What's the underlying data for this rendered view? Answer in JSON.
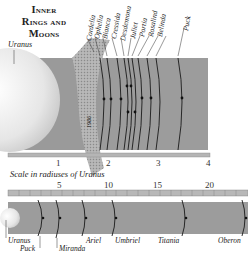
{
  "title": {
    "line1": "Inner",
    "line2": "Rings and",
    "line3": "Moons"
  },
  "top_panel": {
    "planet_label": "Uranus",
    "ring_label": "1986",
    "moon_labels": [
      "Cordelia",
      "Ophelia",
      "Bianca",
      "Cressida",
      "Desdemona",
      "Juliet",
      "Portia",
      "Rosalind",
      "Belinda",
      "Puck"
    ],
    "scale_ticks": [
      "1",
      "2",
      "3",
      "4"
    ]
  },
  "scale_caption": "Scale in radiuses of Uranus",
  "bottom_panel": {
    "scale_ticks": [
      "5",
      "10",
      "15",
      "20"
    ],
    "labels": {
      "uranus": "Uranus",
      "puck": "Puck",
      "miranda": "Miranda",
      "ariel": "Ariel",
      "umbriel": "Umbriel",
      "titania": "Titania",
      "oberon": "Oberon"
    }
  },
  "colors": {
    "band": "#9a9a9a",
    "planet": "#e8e8e8",
    "scale_bar": "#b5b5b5",
    "line": "#1a1a1a"
  }
}
